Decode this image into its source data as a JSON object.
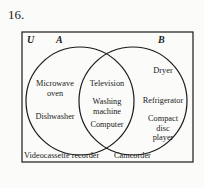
{
  "problem_number": "16.",
  "diagram": {
    "type": "venn",
    "universe_label": "U",
    "sets": [
      {
        "name": "A",
        "label": "A"
      },
      {
        "name": "B",
        "label": "B"
      }
    ],
    "regions": {
      "a_only": [
        "Microwave oven",
        "Dishwasher"
      ],
      "intersection": [
        "Television",
        "Washing machine",
        "Computer"
      ],
      "b_only": [
        "Dryer",
        "Refrigerator",
        "Compact disc player"
      ],
      "outside": [
        "Videocassette recorder",
        "Camcorder"
      ]
    },
    "text": {
      "microwave_l1": "Microwave",
      "microwave_l2": "oven",
      "dishwasher": "Dishwasher",
      "television": "Television",
      "washing_l1": "Washing",
      "washing_l2": "machine",
      "computer": "Computer",
      "dryer": "Dryer",
      "refrigerator": "Refrigerator",
      "cd_l1": "Compact",
      "cd_l2": "disc",
      "cd_l3": "player",
      "vcr": "Videocassette recorder",
      "camcorder": "Camcorder"
    },
    "colors": {
      "stroke": "#1a1a1a",
      "background": "#fbfbf9"
    }
  }
}
